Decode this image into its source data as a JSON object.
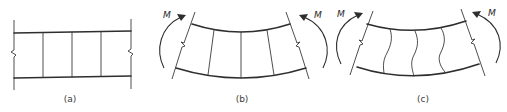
{
  "figure": {
    "panels": [
      {
        "id": "a",
        "caption": "(a)",
        "description": "Undeformed beam segment with vertical plane sections",
        "moment_label": ""
      },
      {
        "id": "b",
        "caption": "(b)",
        "description": "Beam bent by moment M; plane sections remain plane",
        "moment_label_left": "M",
        "moment_label_right": "M"
      },
      {
        "id": "c",
        "caption": "(c)",
        "description": "Beam bent by moment M; sections warp (distorted)",
        "moment_label_left": "M",
        "moment_label_right": "M"
      }
    ],
    "colors": {
      "line": "#2e2e2e",
      "background": "#ffffff"
    }
  }
}
